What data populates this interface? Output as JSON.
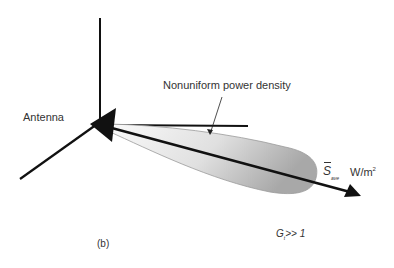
{
  "figure": {
    "panel_label": "(b)",
    "antenna_label": "Antenna",
    "pattern_label": "Nonuniform power density",
    "vector": {
      "symbol": "S",
      "subscript": "ave",
      "units_base": "W/m",
      "units_exp": "2"
    },
    "gain": {
      "symbol": "G",
      "subscript": "t",
      "relation": ">> 1"
    },
    "colors": {
      "line": "#111111",
      "lobe_light": "#f4f4f4",
      "lobe_dark": "#b8b8b8",
      "text": "#333333"
    }
  }
}
